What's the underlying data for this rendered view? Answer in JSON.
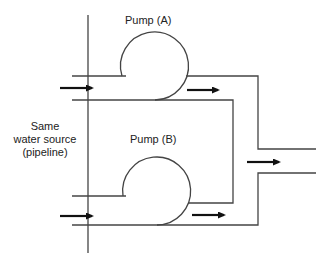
{
  "diagram": {
    "type": "parallel pump piping schematic",
    "labels": {
      "pump_a": "Pump (A)",
      "pump_b": "Pump (B)",
      "source_line1": "Same",
      "source_line2": "water source",
      "source_line3": "(pipeline)"
    },
    "nodes": [
      {
        "id": "source",
        "label": "Same water source (pipeline)"
      },
      {
        "id": "pump_a",
        "label": "Pump (A)"
      },
      {
        "id": "pump_b",
        "label": "Pump (B)"
      },
      {
        "id": "outlet",
        "label": ""
      }
    ],
    "edges": [
      {
        "from": "source",
        "to": "pump_a"
      },
      {
        "from": "source",
        "to": "pump_b"
      },
      {
        "from": "pump_a",
        "to": "outlet"
      },
      {
        "from": "pump_b",
        "to": "outlet"
      }
    ],
    "colors": {
      "line": "#444444",
      "arrow": "#111111",
      "background": "#ffffff"
    }
  }
}
